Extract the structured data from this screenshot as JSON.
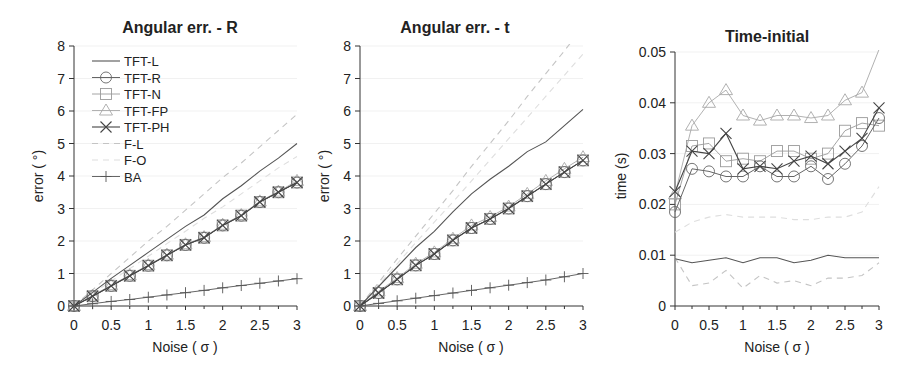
{
  "figure": {
    "panels": [
      {
        "id": "angR",
        "title": "Angular err. - R",
        "xlabel": "Noise ( σ )",
        "ylabel": "error ( °)"
      },
      {
        "id": "angT",
        "title": "Angular err. - t",
        "xlabel": "Noise ( σ )",
        "ylabel": "error ( °)"
      },
      {
        "id": "time",
        "title": "Time-initial",
        "xlabel": "Noise ( σ )",
        "ylabel": "time (s)"
      }
    ],
    "legend": [
      "TFT-L",
      "TFT-R",
      "TFT-N",
      "TFT-FP",
      "TFT-PH",
      "F-L",
      "F-O",
      "BA"
    ]
  },
  "chart_data": [
    {
      "type": "line",
      "title": "Angular err. - R",
      "xlabel": "Noise ( σ )",
      "ylabel": "error ( °)",
      "xlim": [
        0,
        3
      ],
      "ylim": [
        0,
        8
      ],
      "xticks": [
        0,
        0.5,
        1,
        1.5,
        2,
        2.5,
        3
      ],
      "yticks": [
        0,
        1,
        2,
        3,
        4,
        5,
        6,
        7,
        8
      ],
      "legend_position": "upper left",
      "x": [
        0,
        0.25,
        0.5,
        0.75,
        1,
        1.25,
        1.5,
        1.75,
        2,
        2.25,
        2.5,
        2.75,
        3
      ],
      "series": [
        {
          "name": "TFT-L",
          "style": "solid",
          "marker": "none",
          "values": [
            0,
            0.42,
            0.85,
            1.25,
            1.65,
            2.05,
            2.45,
            2.8,
            3.3,
            3.7,
            4.15,
            4.55,
            5.0
          ]
        },
        {
          "name": "TFT-R",
          "style": "solid",
          "marker": "circle",
          "values": [
            0,
            0.3,
            0.62,
            0.93,
            1.24,
            1.56,
            1.88,
            2.1,
            2.48,
            2.78,
            3.2,
            3.5,
            3.8
          ]
        },
        {
          "name": "TFT-N",
          "style": "solid",
          "marker": "square",
          "values": [
            0,
            0.3,
            0.62,
            0.93,
            1.24,
            1.56,
            1.88,
            2.1,
            2.48,
            2.78,
            3.2,
            3.5,
            3.8
          ]
        },
        {
          "name": "TFT-FP",
          "style": "solid",
          "marker": "triangle",
          "values": [
            0,
            0.32,
            0.64,
            0.95,
            1.26,
            1.58,
            1.9,
            2.12,
            2.5,
            2.8,
            3.22,
            3.52,
            3.85
          ]
        },
        {
          "name": "TFT-PH",
          "style": "solid",
          "marker": "x",
          "values": [
            0,
            0.3,
            0.62,
            0.93,
            1.24,
            1.56,
            1.88,
            2.1,
            2.48,
            2.78,
            3.2,
            3.5,
            3.8
          ]
        },
        {
          "name": "F-L",
          "style": "dashed",
          "marker": "none",
          "values": [
            0,
            0.5,
            1.0,
            1.5,
            2.0,
            2.45,
            2.95,
            3.45,
            3.95,
            4.4,
            4.9,
            5.4,
            5.9
          ]
        },
        {
          "name": "F-O",
          "style": "dashed",
          "marker": "none",
          "values": [
            0,
            0.38,
            0.77,
            1.15,
            1.53,
            1.92,
            2.3,
            2.7,
            3.05,
            3.45,
            3.85,
            4.25,
            4.6
          ]
        },
        {
          "name": "BA",
          "style": "solid",
          "marker": "plus",
          "values": [
            0,
            0.07,
            0.14,
            0.2,
            0.27,
            0.34,
            0.41,
            0.48,
            0.56,
            0.63,
            0.7,
            0.77,
            0.84
          ]
        }
      ]
    },
    {
      "type": "line",
      "title": "Angular err. - t",
      "xlabel": "Noise ( σ )",
      "ylabel": "error ( °)",
      "xlim": [
        0,
        3
      ],
      "ylim": [
        0,
        8
      ],
      "xticks": [
        0,
        0.5,
        1,
        1.5,
        2,
        2.5,
        3
      ],
      "yticks": [
        0,
        1,
        2,
        3,
        4,
        5,
        6,
        7,
        8
      ],
      "x": [
        0,
        0.25,
        0.5,
        0.75,
        1,
        1.25,
        1.5,
        1.75,
        2,
        2.25,
        2.5,
        2.75,
        3
      ],
      "series": [
        {
          "name": "TFT-L",
          "style": "solid",
          "marker": "none",
          "values": [
            0,
            0.6,
            1.2,
            1.8,
            2.3,
            2.9,
            3.45,
            3.9,
            4.3,
            4.75,
            5.05,
            5.55,
            6.05
          ]
        },
        {
          "name": "TFT-R",
          "style": "solid",
          "marker": "circle",
          "values": [
            0,
            0.4,
            0.82,
            1.25,
            1.6,
            2.02,
            2.4,
            2.68,
            3.0,
            3.38,
            3.75,
            4.12,
            4.48
          ]
        },
        {
          "name": "TFT-N",
          "style": "solid",
          "marker": "square",
          "values": [
            0,
            0.4,
            0.82,
            1.25,
            1.6,
            2.02,
            2.4,
            2.68,
            3.0,
            3.38,
            3.75,
            4.12,
            4.48
          ]
        },
        {
          "name": "TFT-FP",
          "style": "solid",
          "marker": "triangle",
          "values": [
            0,
            0.45,
            0.86,
            1.3,
            1.65,
            2.07,
            2.48,
            2.74,
            3.06,
            3.45,
            3.85,
            4.22,
            4.58
          ]
        },
        {
          "name": "TFT-PH",
          "style": "solid",
          "marker": "x",
          "values": [
            0,
            0.4,
            0.82,
            1.25,
            1.6,
            2.02,
            2.4,
            2.68,
            3.0,
            3.38,
            3.75,
            4.12,
            4.48
          ]
        },
        {
          "name": "F-L",
          "style": "dashed",
          "marker": "none",
          "values": [
            0,
            0.72,
            1.45,
            2.15,
            2.85,
            3.55,
            4.3,
            5.0,
            5.7,
            6.45,
            7.15,
            7.85,
            8.6
          ]
        },
        {
          "name": "F-O",
          "style": "dashed",
          "marker": "none",
          "values": [
            0,
            0.65,
            1.3,
            1.95,
            2.58,
            3.2,
            3.85,
            4.5,
            5.15,
            5.8,
            6.45,
            7.1,
            7.75
          ]
        },
        {
          "name": "BA",
          "style": "solid",
          "marker": "plus",
          "values": [
            0,
            0.08,
            0.16,
            0.24,
            0.32,
            0.4,
            0.48,
            0.56,
            0.64,
            0.72,
            0.8,
            0.9,
            1.0
          ]
        }
      ]
    },
    {
      "type": "line",
      "title": "Time-initial",
      "xlabel": "Noise ( σ )",
      "ylabel": "time (s)",
      "xlim": [
        0,
        3
      ],
      "ylim": [
        0,
        0.05
      ],
      "xticks": [
        0,
        0.5,
        1,
        1.5,
        2,
        2.5,
        3
      ],
      "yticks": [
        0,
        0.01,
        0.02,
        0.03,
        0.04,
        0.05
      ],
      "x": [
        0,
        0.25,
        0.5,
        0.75,
        1,
        1.25,
        1.5,
        1.75,
        2,
        2.25,
        2.5,
        2.75,
        3
      ],
      "series": [
        {
          "name": "TFT-L",
          "style": "solid",
          "marker": "none",
          "values": [
            0.0093,
            0.0085,
            0.009,
            0.0095,
            0.0085,
            0.0095,
            0.0095,
            0.0085,
            0.009,
            0.01,
            0.0095,
            0.0095,
            0.0095
          ]
        },
        {
          "name": "TFT-R",
          "style": "solid",
          "marker": "circle",
          "values": [
            0.0185,
            0.027,
            0.0265,
            0.0255,
            0.0255,
            0.0275,
            0.0255,
            0.0255,
            0.0275,
            0.025,
            0.028,
            0.0315,
            0.037
          ]
        },
        {
          "name": "TFT-N",
          "style": "solid",
          "marker": "square",
          "values": [
            0.02,
            0.0315,
            0.032,
            0.0285,
            0.029,
            0.0285,
            0.0305,
            0.0305,
            0.029,
            0.03,
            0.0345,
            0.036,
            0.0355
          ]
        },
        {
          "name": "TFT-FP",
          "style": "solid",
          "marker": "triangle",
          "values": [
            0.022,
            0.0355,
            0.04,
            0.0425,
            0.0375,
            0.0365,
            0.0375,
            0.0375,
            0.037,
            0.0375,
            0.0405,
            0.042,
            0.0505
          ]
        },
        {
          "name": "TFT-PH",
          "style": "solid",
          "marker": "x",
          "values": [
            0.0225,
            0.0305,
            0.03,
            0.034,
            0.027,
            0.0275,
            0.027,
            0.0285,
            0.0295,
            0.028,
            0.0305,
            0.033,
            0.039
          ]
        },
        {
          "name": "F-L",
          "style": "dashed",
          "marker": "none",
          "values": [
            0.0095,
            0.004,
            0.0045,
            0.007,
            0.0035,
            0.006,
            0.0045,
            0.005,
            0.004,
            0.0055,
            0.0055,
            0.006,
            0.0085
          ]
        },
        {
          "name": "F-O",
          "style": "dashed",
          "marker": "none",
          "values": [
            0.0145,
            0.0165,
            0.0175,
            0.018,
            0.0175,
            0.0175,
            0.0175,
            0.017,
            0.017,
            0.0175,
            0.0175,
            0.0185,
            0.0235
          ]
        },
        {
          "name": "BA",
          "style": "none",
          "marker": "none",
          "values": []
        }
      ]
    }
  ]
}
